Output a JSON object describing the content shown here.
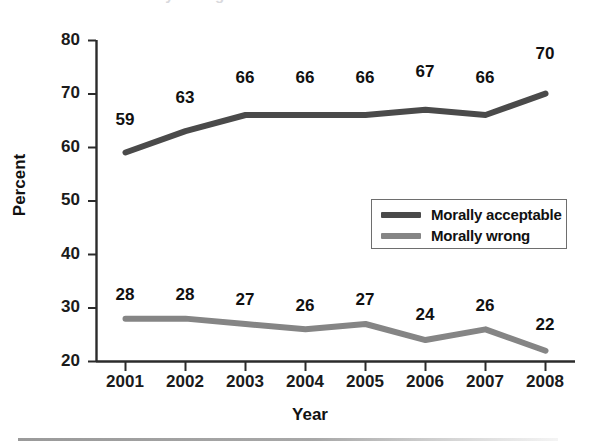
{
  "chart_data": {
    "type": "line",
    "title": "",
    "subtitle": "",
    "xlabel": "Year",
    "ylabel": "Percent",
    "categories": [
      "2001",
      "2002",
      "2003",
      "2004",
      "2005",
      "2006",
      "2007",
      "2008"
    ],
    "x": [
      2001,
      2002,
      2003,
      2004,
      2005,
      2006,
      2007,
      2008
    ],
    "series": [
      {
        "name": "Morally acceptable",
        "color": "#4a4a4a",
        "values": [
          59,
          63,
          66,
          66,
          66,
          67,
          66,
          70
        ]
      },
      {
        "name": "Morally wrong",
        "color": "#858585",
        "values": [
          28,
          28,
          27,
          26,
          27,
          24,
          26,
          22
        ]
      }
    ],
    "ylim": [
      20,
      80
    ],
    "yticks": [
      20,
      30,
      40,
      50,
      60,
      70,
      80
    ],
    "ytick_labels": [
      "20",
      "30",
      "40",
      "50",
      "60",
      "70",
      "80"
    ],
    "xtick_labels": [
      "2001",
      "2002",
      "2003",
      "2004",
      "2005",
      "2006",
      "2007",
      "2008"
    ],
    "grid": false,
    "legend_position": "center-right",
    "data_labels": true,
    "annotations": []
  },
  "axes": {
    "y_title": "Percent",
    "x_title": "Year"
  },
  "legend": {
    "entries": [
      {
        "label": "Morally acceptable",
        "color": "#4a4a4a"
      },
      {
        "label": "Morally wrong",
        "color": "#858585"
      }
    ]
  },
  "artifacts": {
    "top_cropped_text": "Morally wrong"
  }
}
